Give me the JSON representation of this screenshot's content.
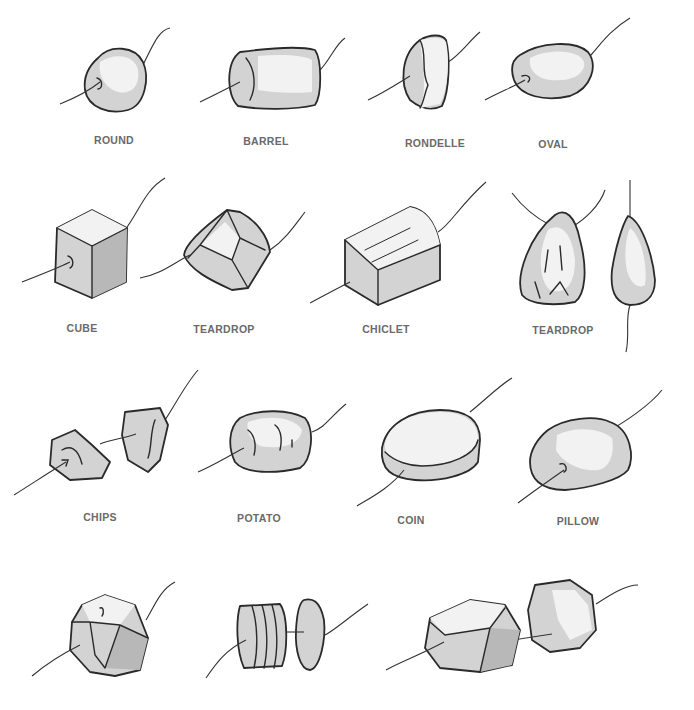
{
  "colors": {
    "background": "#ffffff",
    "label": "#6a6a6a",
    "outline": "#2a2a2a",
    "bead_fill": "#d3d3d3",
    "highlight": "#f2f2f2"
  },
  "rows": [
    {
      "items": [
        {
          "id": "round",
          "label": "ROUND"
        },
        {
          "id": "barrel",
          "label": "BARREL"
        },
        {
          "id": "rondelle",
          "label": "RONDELLE"
        },
        {
          "id": "oval",
          "label": "OVAL"
        }
      ]
    },
    {
      "items": [
        {
          "id": "cube",
          "label": "CUBE"
        },
        {
          "id": "teardrop-faceted",
          "label": "TEARDROP"
        },
        {
          "id": "chiclet",
          "label": "CHICLET"
        },
        {
          "id": "teardrop",
          "label": "TEARDROP"
        }
      ]
    },
    {
      "items": [
        {
          "id": "chips",
          "label": "CHIPS"
        },
        {
          "id": "potato",
          "label": "POTATO"
        },
        {
          "id": "coin",
          "label": "COIN"
        },
        {
          "id": "pillow",
          "label": "PILLOW"
        }
      ]
    },
    {
      "items": [
        {
          "id": "faceted-round",
          "label": ""
        },
        {
          "id": "disks",
          "label": ""
        },
        {
          "id": "nuggets",
          "label": ""
        }
      ]
    }
  ]
}
